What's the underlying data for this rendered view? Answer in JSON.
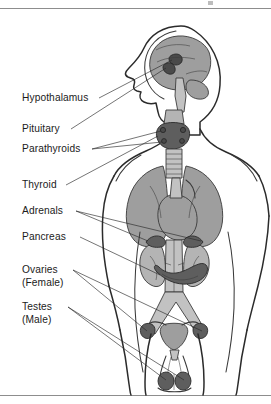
{
  "figure": {
    "background_color": "#ffffff",
    "border_color": "#8d8d8d",
    "label_color": "#1b1b1b",
    "organ_colors": {
      "brain_gray": "#9e9e9e",
      "kidney_gray": "#b4b4b4",
      "gland_dark": "#5e5e5e",
      "gland_very_dark": "#4a4a4a",
      "vessel_gray": "#c2c2c2",
      "outline": "#2b2b2b"
    }
  },
  "labels": [
    {
      "id": "hypothalamus",
      "text": "Hypothalamus",
      "x": 22,
      "y": 101
    },
    {
      "id": "pituitary",
      "text": "Pituitary",
      "x": 22,
      "y": 132
    },
    {
      "id": "parathyroids",
      "text": "Parathyroids",
      "x": 22,
      "y": 152
    },
    {
      "id": "thyroid",
      "text": "Thyroid",
      "x": 22,
      "y": 188
    },
    {
      "id": "adrenals",
      "text": "Adrenals",
      "x": 22,
      "y": 214
    },
    {
      "id": "pancreas",
      "text": "Pancreas",
      "x": 22,
      "y": 240
    },
    {
      "id": "ovaries-line1",
      "text": "Ovaries",
      "x": 22,
      "y": 273
    },
    {
      "id": "ovaries-line2",
      "text": "(Female)",
      "x": 22,
      "y": 286
    },
    {
      "id": "testes-line1",
      "text": "Testes",
      "x": 22,
      "y": 310
    },
    {
      "id": "testes-line2",
      "text": "(Male)",
      "x": 22,
      "y": 323
    }
  ],
  "glands": [
    {
      "id": "hypothalamus",
      "label": "Hypothalamus",
      "region": "brain"
    },
    {
      "id": "pituitary",
      "label": "Pituitary",
      "region": "brain"
    },
    {
      "id": "parathyroids",
      "label": "Parathyroids",
      "region": "neck"
    },
    {
      "id": "thyroid",
      "label": "Thyroid",
      "region": "neck"
    },
    {
      "id": "adrenals",
      "label": "Adrenals",
      "region": "abdomen"
    },
    {
      "id": "pancreas",
      "label": "Pancreas",
      "region": "abdomen"
    },
    {
      "id": "ovaries",
      "label": "Ovaries (Female)",
      "region": "pelvis"
    },
    {
      "id": "testes",
      "label": "Testes (Male)",
      "region": "pelvis"
    }
  ]
}
